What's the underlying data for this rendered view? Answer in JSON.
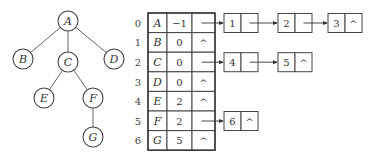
{
  "tree": {
    "nodes": [
      {
        "id": "A",
        "label": "A",
        "x": 68,
        "y": 21
      },
      {
        "id": "B",
        "label": "B",
        "x": 23,
        "y": 59
      },
      {
        "id": "C",
        "label": "C",
        "x": 68,
        "y": 62
      },
      {
        "id": "D",
        "label": "D",
        "x": 114,
        "y": 59
      },
      {
        "id": "E",
        "label": "E",
        "x": 44,
        "y": 98
      },
      {
        "id": "F",
        "label": "F",
        "x": 93,
        "y": 98
      },
      {
        "id": "G",
        "label": "G",
        "x": 93,
        "y": 137
      }
    ],
    "edges": [
      [
        "A",
        "B"
      ],
      [
        "A",
        "C"
      ],
      [
        "A",
        "D"
      ],
      [
        "C",
        "E"
      ],
      [
        "C",
        "F"
      ],
      [
        "F",
        "G"
      ]
    ]
  },
  "table": {
    "rows": [
      {
        "index": "0",
        "data": "A",
        "parent": "−1",
        "firstchild": ""
      },
      {
        "index": "1",
        "data": "B",
        "parent": "0",
        "firstchild": "^"
      },
      {
        "index": "2",
        "data": "C",
        "parent": "0",
        "firstchild": ""
      },
      {
        "index": "3",
        "data": "D",
        "parent": "0",
        "firstchild": "^"
      },
      {
        "index": "4",
        "data": "E",
        "parent": "2",
        "firstchild": "^"
      },
      {
        "index": "5",
        "data": "F",
        "parent": "2",
        "firstchild": ""
      },
      {
        "index": "6",
        "data": "G",
        "parent": "5",
        "firstchild": "^"
      }
    ]
  },
  "child_lists": [
    {
      "row": 0,
      "nodes": [
        {
          "value": "1",
          "next": ""
        },
        {
          "value": "2",
          "next": ""
        },
        {
          "value": "3",
          "next": "^"
        }
      ]
    },
    {
      "row": 2,
      "nodes": [
        {
          "value": "4",
          "next": ""
        },
        {
          "value": "5",
          "next": "^"
        }
      ]
    },
    {
      "row": 5,
      "nodes": [
        {
          "value": "6",
          "next": "^"
        }
      ]
    }
  ]
}
